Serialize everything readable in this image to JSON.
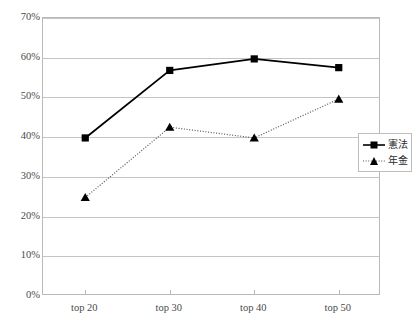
{
  "chart_data": {
    "type": "line",
    "title": "",
    "xlabel": "",
    "ylabel": "",
    "categories": [
      "top 20",
      "top 30",
      "top 40",
      "top 50"
    ],
    "ylim": [
      0,
      70
    ],
    "ytick_labels": [
      "0%",
      "10%",
      "20%",
      "30%",
      "40%",
      "50%",
      "60%",
      "70%"
    ],
    "ytick_values": [
      0,
      10,
      20,
      30,
      40,
      50,
      60,
      70
    ],
    "grid": true,
    "legend_position": "right",
    "series": [
      {
        "name": "憲法",
        "values": [
          39.8,
          56.8,
          59.7,
          57.5
        ],
        "color": "#000000",
        "line_style": "solid",
        "marker": "square"
      },
      {
        "name": "年金",
        "values": [
          24.8,
          42.5,
          39.8,
          49.6
        ],
        "color": "#555555",
        "line_style": "dotted",
        "marker": "triangle"
      }
    ]
  },
  "legend": {
    "items": [
      {
        "label": "憲法"
      },
      {
        "label": "年金"
      }
    ]
  }
}
